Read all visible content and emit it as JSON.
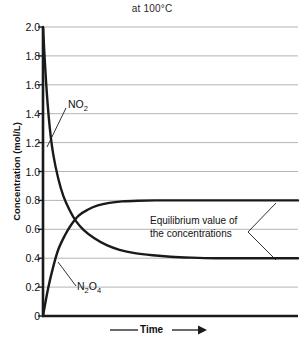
{
  "chart_data": {
    "type": "line",
    "title": "at 100°C",
    "xlabel": "Time",
    "ylabel": "Concentration (mol/L)",
    "ylim": [
      0,
      2.0
    ],
    "ytick_labels": [
      "2.0",
      "1.8",
      "1.6",
      "1.4",
      "1.2",
      "1.0",
      "0.8",
      "0.6",
      "0.4",
      "0.2",
      "0"
    ],
    "ytick_values": [
      2.0,
      1.8,
      1.6,
      1.4,
      1.2,
      1.0,
      0.8,
      0.6,
      0.4,
      0.2,
      0
    ],
    "xtick_labels": [],
    "grid": true,
    "legend": "none",
    "series": [
      {
        "name": "NO2",
        "label_html": "NO<sub>2</sub>",
        "color": "#1a1a1a",
        "start_value": 2.0,
        "equilibrium_value": 0.4,
        "direction": "decreasing",
        "points": [
          [
            0.0,
            2.0
          ],
          [
            0.012,
            1.62
          ],
          [
            0.025,
            1.33
          ],
          [
            0.04,
            1.12
          ],
          [
            0.06,
            0.95
          ],
          [
            0.08,
            0.83
          ],
          [
            0.105,
            0.73
          ],
          [
            0.13,
            0.655
          ],
          [
            0.16,
            0.595
          ],
          [
            0.2,
            0.54
          ],
          [
            0.25,
            0.49
          ],
          [
            0.3,
            0.458
          ],
          [
            0.36,
            0.435
          ],
          [
            0.43,
            0.42
          ],
          [
            0.5,
            0.41
          ],
          [
            0.58,
            0.404
          ],
          [
            0.68,
            0.4
          ],
          [
            0.8,
            0.4
          ],
          [
            1.0,
            0.4
          ]
        ]
      },
      {
        "name": "N2O4",
        "label_html": "N<sub>2</sub>O<sub>4</sub>",
        "color": "#1a1a1a",
        "start_value": 0.0,
        "equilibrium_value": 0.8,
        "direction": "increasing",
        "points": [
          [
            0.0,
            0.0
          ],
          [
            0.02,
            0.19
          ],
          [
            0.04,
            0.34
          ],
          [
            0.06,
            0.46
          ],
          [
            0.085,
            0.555
          ],
          [
            0.11,
            0.63
          ],
          [
            0.14,
            0.695
          ],
          [
            0.175,
            0.735
          ],
          [
            0.215,
            0.765
          ],
          [
            0.26,
            0.783
          ],
          [
            0.31,
            0.793
          ],
          [
            0.37,
            0.798
          ],
          [
            0.44,
            0.8
          ],
          [
            0.55,
            0.8
          ],
          [
            0.7,
            0.8
          ],
          [
            1.0,
            0.8
          ]
        ]
      }
    ],
    "crossover": {
      "x": 0.135,
      "y": 0.58
    },
    "annotations": [
      {
        "name": "equilibrium-note",
        "line1": "Equilibrium value of",
        "line2": "the concentrations"
      }
    ]
  },
  "colors": {
    "axis": "#1a1a1a",
    "grid": "#b4b4b4",
    "curve": "#1a1a1a",
    "text": "#111111",
    "background": "#ffffff"
  }
}
